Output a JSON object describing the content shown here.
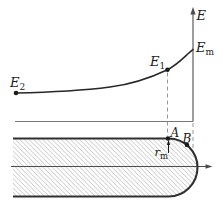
{
  "figure": {
    "labels": {
      "e_axis": "E",
      "e_max": {
        "base": "E",
        "sub": "m"
      },
      "e1": {
        "base": "E",
        "sub": "1"
      },
      "e2": {
        "base": "E",
        "sub": "2"
      },
      "point_a": "A",
      "point_b": "B",
      "r_m": {
        "base": "r",
        "sub": "m"
      }
    },
    "colors": {
      "background": "#ffffff",
      "ink": "#1c1c1c",
      "curve": "#262626",
      "boundary": "#303030",
      "axis": "#4d4d4d",
      "thin_line": "#787878",
      "dashed_line": "#8c8c8c",
      "hatch": "#bdbdbd"
    }
  }
}
